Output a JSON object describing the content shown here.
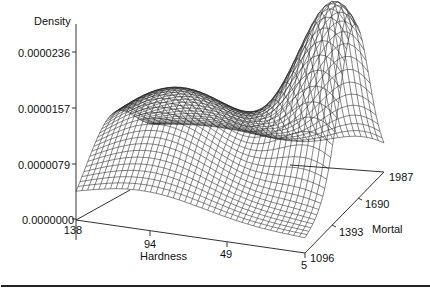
{
  "chart_data": {
    "type": "surface3d",
    "title": "",
    "zlabel": "Density",
    "xlabel": "Hardness",
    "ylabel": "Mortal",
    "z_ticks": [
      "0.0000000",
      "0.0000079",
      "0.0000157",
      "0.0000236"
    ],
    "x_ticks": [
      "138",
      "94",
      "49",
      "5"
    ],
    "y_ticks": [
      "1096",
      "1393",
      "1690",
      "1987"
    ],
    "xlim": [
      5,
      138
    ],
    "ylim": [
      1096,
      1987
    ],
    "zlim": [
      0,
      2.36e-05
    ],
    "grid": false,
    "legend": null,
    "modes": [
      {
        "hardness": 100,
        "mortal": 1500,
        "density": 1.2e-05
      },
      {
        "hardness": 15,
        "mortal": 1650,
        "density": 2.5e-05
      }
    ]
  },
  "labels": {
    "density": "Density",
    "hardness": "Hardness",
    "mortal": "Mortal",
    "z0": "0.0000000",
    "z1": "0.0000079",
    "z2": "0.0000157",
    "z3": "0.0000236",
    "x0": "138",
    "x1": "94",
    "x2": "49",
    "x3": "5",
    "y0": "1096",
    "y1": "1393",
    "y2": "1690",
    "y3": "1987"
  }
}
